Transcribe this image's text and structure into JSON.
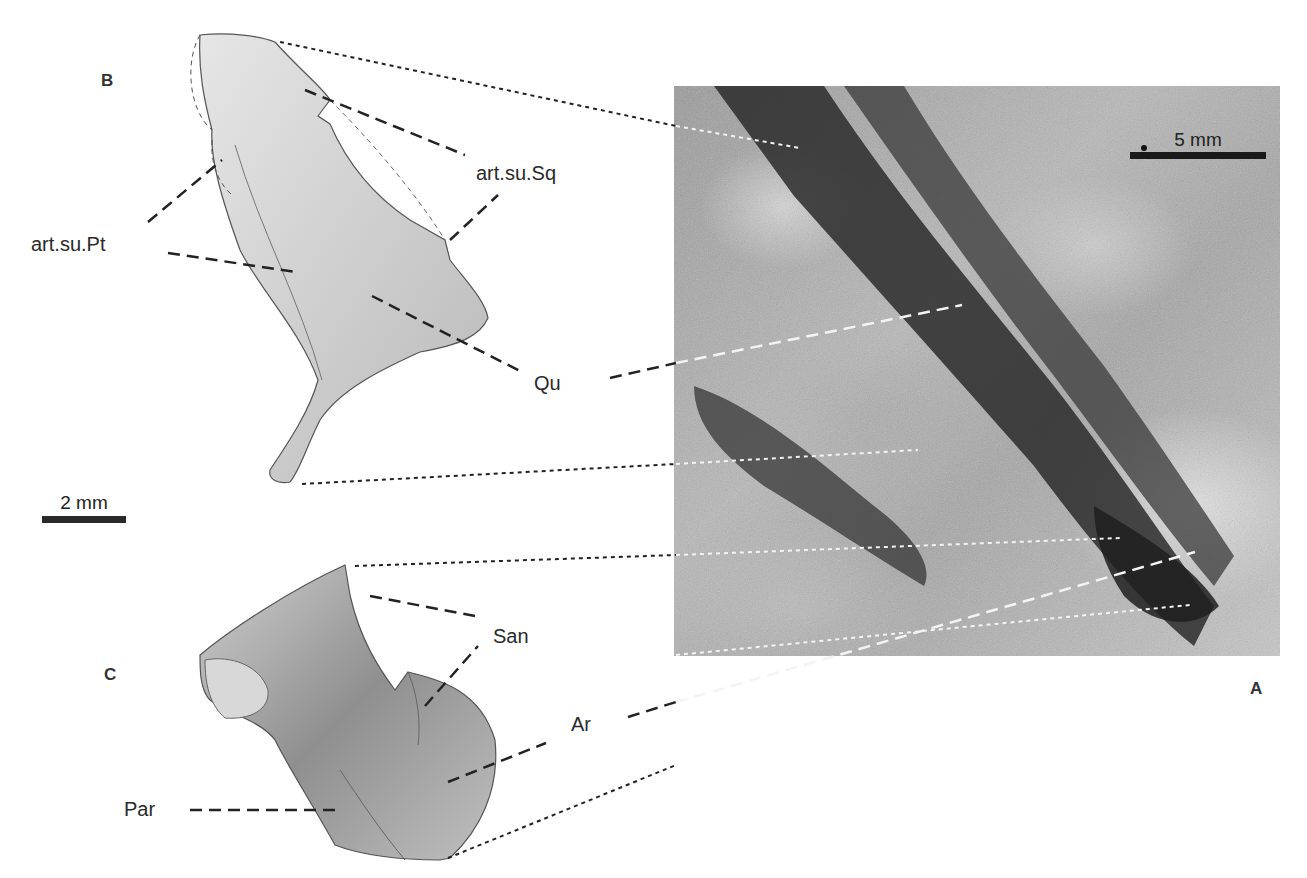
{
  "figure": {
    "panels": {
      "A": {
        "letter": "A",
        "type": "photograph",
        "scale_bar": "5 mm"
      },
      "B": {
        "letter": "B",
        "type": "drawing",
        "scale_bar": "2 mm"
      },
      "C": {
        "letter": "C",
        "type": "drawing"
      }
    },
    "labels": {
      "art_su_sq": "art.su.Sq",
      "art_su_pt": "art.su.Pt",
      "qu": "Qu",
      "san": "San",
      "ar": "Ar",
      "par": "Par"
    },
    "scale_bars": {
      "photo": "5 mm",
      "drawing": "2 mm"
    }
  }
}
